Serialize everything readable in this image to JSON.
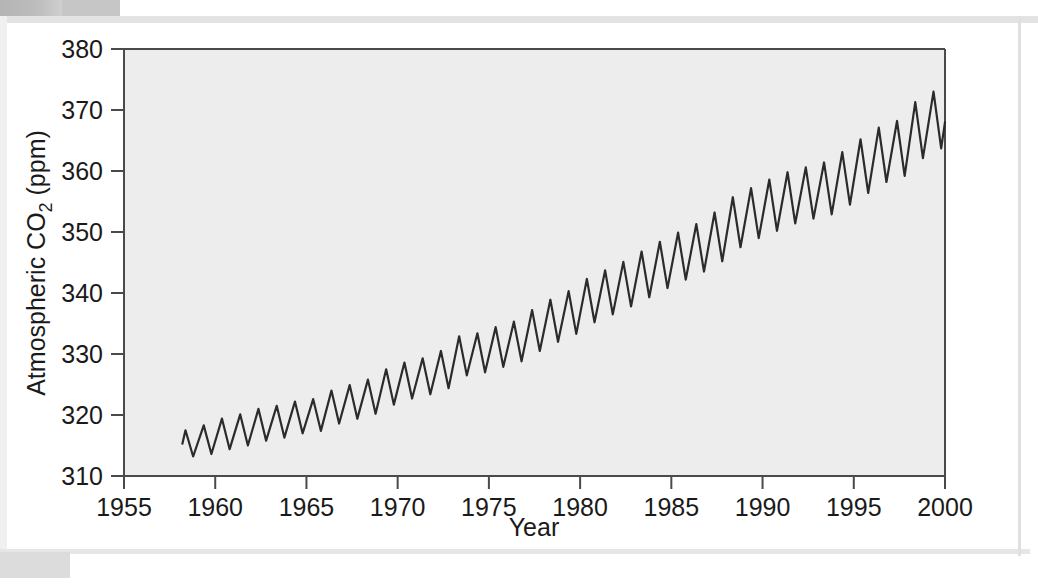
{
  "figure": {
    "kind": "scanned-textbook-figure",
    "panel_background": "#ffffff",
    "plot_background": "#ededed",
    "line_color": "#2b2b2b",
    "axis_color": "#4a4a4a",
    "text_color": "#1a1a1a"
  },
  "labels": {
    "y_axis_main": "Atmospheric CO",
    "y_axis_sub": "2",
    "y_axis_unit": " (ppm)",
    "x_axis_title": "Year"
  },
  "chart_data": {
    "type": "line",
    "title": "",
    "subtitle": "",
    "xlabel": "Year",
    "ylabel": "Atmospheric CO2 (ppm)",
    "xlim": [
      1955,
      2000
    ],
    "ylim": [
      310,
      380
    ],
    "xticks": [
      1955,
      1960,
      1965,
      1970,
      1975,
      1980,
      1985,
      1990,
      1995,
      2000
    ],
    "yticks": [
      310,
      320,
      330,
      340,
      350,
      360,
      370,
      380
    ],
    "xtick_labels": [
      "1955",
      "1960",
      "1965",
      "1970",
      "1975",
      "1980",
      "1985",
      "1990",
      "1995",
      "2000"
    ],
    "ytick_labels": [
      "310",
      "320",
      "330",
      "340",
      "350",
      "360",
      "370",
      "380"
    ],
    "grid": false,
    "legend": null,
    "annotations": [],
    "series": [
      {
        "name": "Atmospheric CO2 (Mauna Loa monthly mean)",
        "color": "#2b2b2b",
        "line_width": 2.2,
        "marker": "none",
        "x_start": 1958.2,
        "x_end": 2000.0,
        "description": "Keeling curve: rising trend with annual sawtooth oscillation, peak in May, trough in October",
        "annual": [
          {
            "year": 1958,
            "mean": 315.3,
            "max": 317.5,
            "min": 313.2
          },
          {
            "year": 1959,
            "mean": 315.9,
            "max": 318.3,
            "min": 313.6
          },
          {
            "year": 1960,
            "mean": 316.9,
            "max": 319.4,
            "min": 314.4
          },
          {
            "year": 1961,
            "mean": 317.6,
            "max": 320.1,
            "min": 315.0
          },
          {
            "year": 1962,
            "mean": 318.4,
            "max": 321.0,
            "min": 315.8
          },
          {
            "year": 1963,
            "mean": 318.9,
            "max": 321.5,
            "min": 316.3
          },
          {
            "year": 1964,
            "mean": 319.6,
            "max": 322.2,
            "min": 317.0
          },
          {
            "year": 1965,
            "mean": 320.0,
            "max": 322.6,
            "min": 317.4
          },
          {
            "year": 1966,
            "mean": 321.3,
            "max": 324.0,
            "min": 318.6
          },
          {
            "year": 1967,
            "mean": 322.1,
            "max": 324.9,
            "min": 319.4
          },
          {
            "year": 1968,
            "mean": 323.0,
            "max": 325.8,
            "min": 320.2
          },
          {
            "year": 1969,
            "mean": 324.6,
            "max": 327.5,
            "min": 321.7
          },
          {
            "year": 1970,
            "mean": 325.6,
            "max": 328.6,
            "min": 322.7
          },
          {
            "year": 1971,
            "mean": 326.3,
            "max": 329.3,
            "min": 323.4
          },
          {
            "year": 1972,
            "mean": 327.4,
            "max": 330.5,
            "min": 324.4
          },
          {
            "year": 1973,
            "mean": 329.7,
            "max": 332.9,
            "min": 326.5
          },
          {
            "year": 1974,
            "mean": 330.2,
            "max": 333.4,
            "min": 327.0
          },
          {
            "year": 1975,
            "mean": 331.1,
            "max": 334.4,
            "min": 327.9
          },
          {
            "year": 1976,
            "mean": 332.0,
            "max": 335.3,
            "min": 328.8
          },
          {
            "year": 1977,
            "mean": 333.8,
            "max": 337.2,
            "min": 330.5
          },
          {
            "year": 1978,
            "mean": 335.4,
            "max": 338.9,
            "min": 332.0
          },
          {
            "year": 1979,
            "mean": 336.8,
            "max": 340.3,
            "min": 333.3
          },
          {
            "year": 1980,
            "mean": 338.7,
            "max": 342.3,
            "min": 335.2
          },
          {
            "year": 1981,
            "mean": 340.1,
            "max": 343.7,
            "min": 336.5
          },
          {
            "year": 1982,
            "mean": 341.4,
            "max": 345.1,
            "min": 337.8
          },
          {
            "year": 1983,
            "mean": 343.0,
            "max": 346.8,
            "min": 339.3
          },
          {
            "year": 1984,
            "mean": 344.6,
            "max": 348.4,
            "min": 340.8
          },
          {
            "year": 1985,
            "mean": 346.0,
            "max": 349.9,
            "min": 342.2
          },
          {
            "year": 1986,
            "mean": 347.4,
            "max": 351.3,
            "min": 343.5
          },
          {
            "year": 1987,
            "mean": 349.2,
            "max": 353.2,
            "min": 345.2
          },
          {
            "year": 1988,
            "mean": 351.6,
            "max": 355.7,
            "min": 347.5
          },
          {
            "year": 1989,
            "mean": 353.1,
            "max": 357.2,
            "min": 349.0
          },
          {
            "year": 1990,
            "mean": 354.4,
            "max": 358.6,
            "min": 350.2
          },
          {
            "year": 1991,
            "mean": 355.6,
            "max": 359.8,
            "min": 351.4
          },
          {
            "year": 1992,
            "mean": 356.4,
            "max": 360.6,
            "min": 352.2
          },
          {
            "year": 1993,
            "mean": 357.1,
            "max": 361.4,
            "min": 352.9
          },
          {
            "year": 1994,
            "mean": 358.8,
            "max": 363.1,
            "min": 354.5
          },
          {
            "year": 1995,
            "mean": 360.8,
            "max": 365.2,
            "min": 356.4
          },
          {
            "year": 1996,
            "mean": 362.6,
            "max": 367.1,
            "min": 358.2
          },
          {
            "year": 1997,
            "mean": 363.7,
            "max": 368.2,
            "min": 359.2
          },
          {
            "year": 1998,
            "mean": 366.7,
            "max": 371.3,
            "min": 362.1
          },
          {
            "year": 1999,
            "mean": 368.4,
            "max": 373.0,
            "min": 363.7
          },
          {
            "year": 2000,
            "mean": 369.5,
            "max": 370.5,
            "min": 368.0
          }
        ]
      }
    ]
  }
}
